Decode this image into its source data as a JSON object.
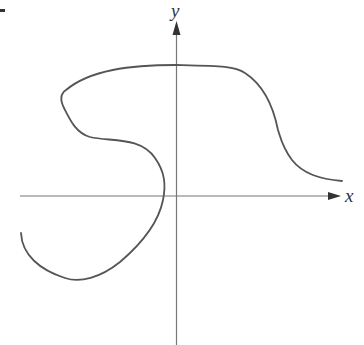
{
  "figure": {
    "x_axis_label": "x",
    "y_axis_label": "y",
    "curve_description": "Smooth S-shaped curve crossing the y-axis at top, looping left and crossing x-axis near origin on the negative side",
    "colors": {
      "curve": "#555555",
      "axes": "#777777",
      "labels": "#333333"
    }
  }
}
